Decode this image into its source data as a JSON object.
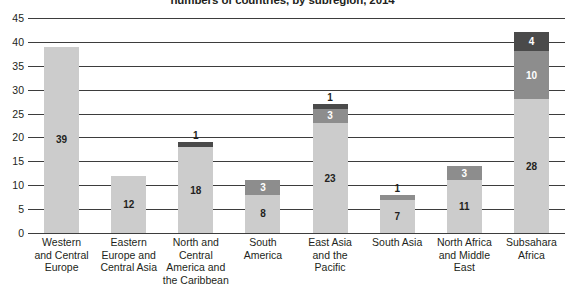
{
  "chart_data": {
    "type": "bar",
    "subtype": "stacked-bar",
    "title": "numbers of countries, by subregion, 2014",
    "xlabel": "",
    "ylabel": "",
    "ylim": [
      0,
      45
    ],
    "ytick_step": 5,
    "yticks": [
      "45",
      "40",
      "35",
      "30",
      "25",
      "20",
      "15",
      "10",
      "5",
      "0"
    ],
    "grid": true,
    "legend": "none",
    "categories": [
      "Western and Central Europe",
      "Eastern Europe and Central Asia",
      "North and Central America and the Caribbean",
      "South America",
      "East Asia and the Pacific",
      "South Asia",
      "North Africa and Middle East",
      "Subsahara Africa"
    ],
    "category_lines": [
      [
        "Western",
        "and Central",
        "Europe"
      ],
      [
        "Eastern",
        "Europe and",
        "Central Asia"
      ],
      [
        "North and",
        "Central",
        "America and",
        "the Caribbean"
      ],
      [
        "South",
        "America"
      ],
      [
        "East Asia",
        "and the",
        "Pacific"
      ],
      [
        "South Asia"
      ],
      [
        "North Africa",
        "and Middle",
        "East"
      ],
      [
        "Subsahara",
        "Africa"
      ]
    ],
    "series": [
      {
        "name": "light",
        "color": "#cccccc",
        "values": [
          39,
          12,
          18,
          8,
          23,
          7,
          11,
          28
        ]
      },
      {
        "name": "medium",
        "color": "#8d8d8d",
        "values": [
          0,
          0,
          0,
          3,
          3,
          1,
          3,
          10
        ]
      },
      {
        "name": "dark",
        "color": "#4a4a4a",
        "values": [
          0,
          0,
          1,
          0,
          1,
          0,
          0,
          4
        ]
      }
    ],
    "totals": [
      39,
      12,
      19,
      11,
      27,
      8,
      14,
      42
    ],
    "bars": [
      {
        "category": "Western and Central Europe",
        "total": 39,
        "segments": [
          {
            "value": 39,
            "label": "39",
            "shade": "light",
            "label_position": "inside"
          }
        ]
      },
      {
        "category": "Eastern Europe and Central Asia",
        "total": 12,
        "segments": [
          {
            "value": 12,
            "label": "12",
            "shade": "light",
            "label_position": "inside"
          }
        ]
      },
      {
        "category": "North and Central America and the Caribbean",
        "total": 19,
        "segments": [
          {
            "value": 18,
            "label": "18",
            "shade": "light",
            "label_position": "inside"
          },
          {
            "value": 1,
            "label": "1",
            "shade": "dark",
            "label_position": "above"
          }
        ]
      },
      {
        "category": "South America",
        "total": 11,
        "segments": [
          {
            "value": 8,
            "label": "8",
            "shade": "light",
            "label_position": "inside"
          },
          {
            "value": 3,
            "label": "3",
            "shade": "medium",
            "label_position": "inside"
          }
        ]
      },
      {
        "category": "East Asia and the Pacific",
        "total": 27,
        "segments": [
          {
            "value": 23,
            "label": "23",
            "shade": "light",
            "label_position": "inside"
          },
          {
            "value": 3,
            "label": "3",
            "shade": "medium",
            "label_position": "inside"
          },
          {
            "value": 1,
            "label": "1",
            "shade": "dark",
            "label_position": "above"
          }
        ]
      },
      {
        "category": "South Asia",
        "total": 8,
        "segments": [
          {
            "value": 7,
            "label": "7",
            "shade": "light",
            "label_position": "inside"
          },
          {
            "value": 1,
            "label": "1",
            "shade": "medium",
            "label_position": "above"
          }
        ]
      },
      {
        "category": "North Africa and Middle East",
        "total": 14,
        "segments": [
          {
            "value": 11,
            "label": "11",
            "shade": "light",
            "label_position": "inside"
          },
          {
            "value": 3,
            "label": "3",
            "shade": "medium",
            "label_position": "inside"
          }
        ]
      },
      {
        "category": "Subsahara Africa",
        "total": 42,
        "segments": [
          {
            "value": 28,
            "label": "28",
            "shade": "light",
            "label_position": "inside"
          },
          {
            "value": 10,
            "label": "10",
            "shade": "medium",
            "label_position": "inside"
          },
          {
            "value": 4,
            "label": "4",
            "shade": "dark",
            "label_position": "inside"
          }
        ]
      }
    ],
    "colors": {
      "light": "#cccccc",
      "medium": "#8d8d8d",
      "dark": "#4a4a4a",
      "axis": "#3d3d3d",
      "text": "#231f20",
      "background": "#ffffff"
    }
  }
}
